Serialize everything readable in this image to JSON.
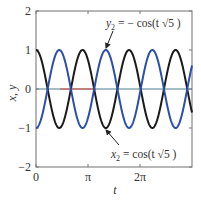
{
  "chart_data": {
    "type": "line",
    "title": "",
    "xlabel": "t",
    "ylabel": "x, y",
    "xlim": [
      0,
      9.42
    ],
    "ylim": [
      -2,
      2
    ],
    "grid": false,
    "legend": "none",
    "x_ticks": [
      {
        "value": 0,
        "label": "0"
      },
      {
        "value": 3.14159,
        "label": "π"
      },
      {
        "value": 6.28318,
        "label": "2π"
      }
    ],
    "y_ticks": [
      {
        "value": 2,
        "label": "2"
      },
      {
        "value": 1,
        "label": "1"
      },
      {
        "value": 0,
        "label": "0"
      },
      {
        "value": -1,
        "label": "−1"
      },
      {
        "value": -2,
        "label": "−2"
      }
    ],
    "series": [
      {
        "name": "x2",
        "formula": "cos(t√5)",
        "amplitude": 1,
        "omega": 2.236068,
        "sign": 1,
        "color": "#1a1a1a"
      },
      {
        "name": "y2",
        "formula": "−cos(t√5)",
        "amplitude": 1,
        "omega": 2.236068,
        "sign": -1,
        "color": "#2b4fa8"
      }
    ],
    "zero_line": {
      "color": "#4a7a8a",
      "highlight_color": "#d9463a",
      "highlight_from_t": 1.45,
      "highlight_to_t": 3.6
    },
    "annotations": [
      {
        "text_main": "y",
        "sub": "2",
        "rest": " = − cos(t √5 )",
        "x": 106,
        "y": 27,
        "arrow_from": [
          113,
          31
        ],
        "arrow_to": [
          106,
          48
        ]
      },
      {
        "text_main": "x",
        "sub": "2",
        "rest": " = cos(t √5 )",
        "x": 111,
        "y": 158,
        "arrow_from": [
          119,
          145
        ],
        "arrow_to": [
          106,
          130
        ]
      }
    ]
  }
}
